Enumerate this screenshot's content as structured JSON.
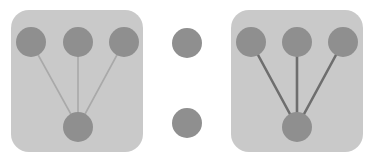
{
  "canvas": {
    "width": 371,
    "height": 164,
    "background": "#ffffff"
  },
  "palette": {
    "panel_fill": "#c9c9c9",
    "node_fill": "#8f8f8f",
    "edge_light": "#a9a9a9",
    "edge_dark": "#6e6e6e",
    "background": "#ffffff"
  },
  "diagram": {
    "type": "node-link-graph",
    "node_radius": 15,
    "groups": [
      {
        "id": "group-left",
        "label": "left-group",
        "panel": {
          "x": 11,
          "y": 10,
          "width": 132,
          "height": 142,
          "radius": 18,
          "fill": "#c9c9c9"
        },
        "edge_style": {
          "color": "#a9a9a9",
          "width": 1.6
        },
        "nodes": [
          {
            "id": "L1",
            "role": "leaf",
            "cx": 31,
            "cy": 42,
            "r": 15,
            "fill": "#8f8f8f"
          },
          {
            "id": "L2",
            "role": "leaf",
            "cx": 78,
            "cy": 42,
            "r": 15,
            "fill": "#8f8f8f"
          },
          {
            "id": "L3",
            "role": "leaf",
            "cx": 124,
            "cy": 42,
            "r": 15,
            "fill": "#8f8f8f"
          },
          {
            "id": "L0",
            "role": "hub",
            "cx": 78,
            "cy": 127,
            "r": 15,
            "fill": "#8f8f8f"
          }
        ],
        "edges": [
          {
            "from": "L1",
            "to": "L0"
          },
          {
            "from": "L2",
            "to": "L0"
          },
          {
            "from": "L3",
            "to": "L0"
          }
        ]
      },
      {
        "id": "group-right",
        "label": "right-group",
        "panel": {
          "x": 231,
          "y": 10,
          "width": 132,
          "height": 142,
          "radius": 18,
          "fill": "#c9c9c9"
        },
        "edge_style": {
          "color": "#6e6e6e",
          "width": 2.6
        },
        "nodes": [
          {
            "id": "R1",
            "role": "leaf",
            "cx": 251,
            "cy": 42,
            "r": 15,
            "fill": "#8f8f8f"
          },
          {
            "id": "R2",
            "role": "leaf",
            "cx": 297,
            "cy": 42,
            "r": 15,
            "fill": "#8f8f8f"
          },
          {
            "id": "R3",
            "role": "leaf",
            "cx": 343,
            "cy": 42,
            "r": 15,
            "fill": "#8f8f8f"
          },
          {
            "id": "R0",
            "role": "hub",
            "cx": 297,
            "cy": 127,
            "r": 15,
            "fill": "#8f8f8f"
          }
        ],
        "edges": [
          {
            "from": "R1",
            "to": "R0"
          },
          {
            "from": "R2",
            "to": "R0"
          },
          {
            "from": "R3",
            "to": "R0"
          }
        ]
      }
    ],
    "standalone_nodes": [
      {
        "id": "M1",
        "label": "middle-top-node",
        "cx": 187,
        "cy": 43,
        "r": 15,
        "fill": "#8f8f8f"
      },
      {
        "id": "M2",
        "label": "middle-bottom-node",
        "cx": 187,
        "cy": 123,
        "r": 15,
        "fill": "#8f8f8f"
      }
    ]
  }
}
